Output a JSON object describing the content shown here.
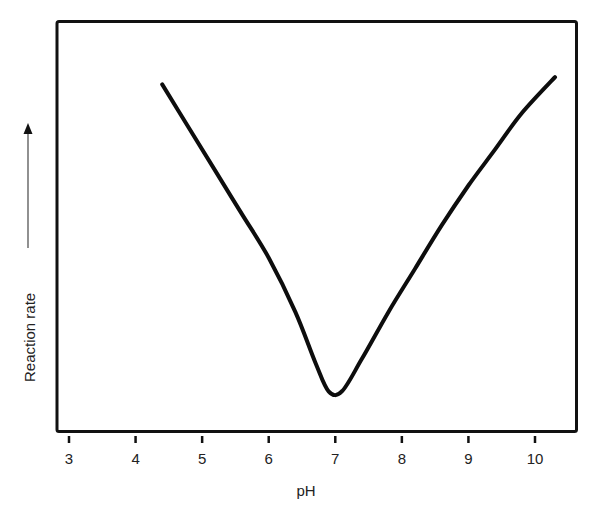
{
  "chart_data": {
    "type": "line",
    "title": "",
    "xlabel": "pH",
    "ylabel": "Reaction rate",
    "ylabel_arrow": true,
    "xlim": [
      2.9,
      10.6
    ],
    "ylim": [
      0,
      1
    ],
    "x_ticks": [
      3,
      4,
      5,
      6,
      7,
      8,
      9,
      10
    ],
    "y_ticks": [],
    "grid": false,
    "legend": null,
    "series": [
      {
        "name": "Reaction rate vs pH",
        "x": [
          4.4,
          4.8,
          5.2,
          5.6,
          6.0,
          6.4,
          6.7,
          6.9,
          7.1,
          7.4,
          7.8,
          8.2,
          8.6,
          9.0,
          9.4,
          9.8,
          10.3
        ],
        "y": [
          0.96,
          0.84,
          0.72,
          0.6,
          0.48,
          0.33,
          0.19,
          0.11,
          0.11,
          0.2,
          0.33,
          0.45,
          0.57,
          0.68,
          0.78,
          0.88,
          0.98
        ]
      }
    ],
    "annotations": [
      "minimum rate at pH ≈ 7"
    ]
  }
}
